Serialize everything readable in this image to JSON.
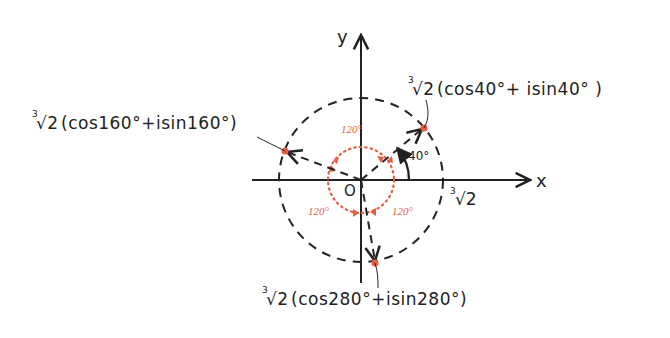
{
  "diagram": {
    "colors": {
      "ink": "#222222",
      "accent": "#f05a3c",
      "background": "#ffffff"
    },
    "axes": {
      "x_label": "x",
      "y_label": "y",
      "origin_label": "O",
      "x_intercept_label": "∛2",
      "x_intercept_index": "3",
      "x_intercept_radical": "√2"
    },
    "circle": {
      "radius_label": "∛2",
      "style": "dashed"
    },
    "angle_marker": {
      "label": "40°",
      "degrees": 40
    },
    "separation_angles": [
      {
        "label": "120°",
        "position": "top"
      },
      {
        "label": "120°",
        "position": "bottom-left"
      },
      {
        "label": "120°",
        "position": "bottom-right"
      }
    ],
    "roots": [
      {
        "angle": 40,
        "index": "3",
        "radical": "√2",
        "expr": "(cos40°+ isin40° )",
        "full": "∛2(cos40°+ isin40°)"
      },
      {
        "angle": 160,
        "index": "3",
        "radical": "√2",
        "expr": "(cos160°+isin160°)",
        "full": "∛2(cos160°+isin160°)"
      },
      {
        "angle": 280,
        "index": "3",
        "radical": "√2",
        "expr": "(cos280°+isin280°)",
        "full": "∛2(cos280°+isin280°)"
      }
    ]
  }
}
